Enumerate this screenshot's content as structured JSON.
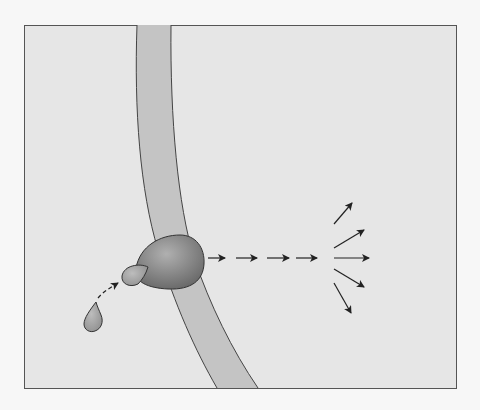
{
  "diagram": {
    "type": "signal-transduction",
    "labels": [],
    "colors": {
      "page_background": "#f7f7f7",
      "panel_background": "#e6e6e6",
      "panel_border": "#555555",
      "membrane_fill": "#c4c4c4",
      "membrane_stroke": "#444444",
      "receptor_fill_light": "#a8a8a8",
      "receptor_fill_dark": "#6e6e6e",
      "ligand_fill": "#a5a5a5",
      "arrow_color": "#222222"
    },
    "elements": {
      "panel": {
        "x": 24,
        "y": 25,
        "width": 432,
        "height": 363
      },
      "membrane": {
        "description": "curved cell membrane band"
      },
      "receptor": {
        "description": "membrane receptor protein with bound ligand"
      },
      "ligand_free": {
        "description": "free signaling molecule (droplet)"
      },
      "ligand_bound": {
        "description": "ligand bound to receptor"
      },
      "approach_arrow": {
        "description": "dashed arrow from free ligand to receptor"
      },
      "signal_cascade": {
        "arrow_count": 4,
        "description": "dashed chain of arrows"
      },
      "response_fan": {
        "arrow_count": 5,
        "description": "arrows radiating outward"
      }
    }
  }
}
